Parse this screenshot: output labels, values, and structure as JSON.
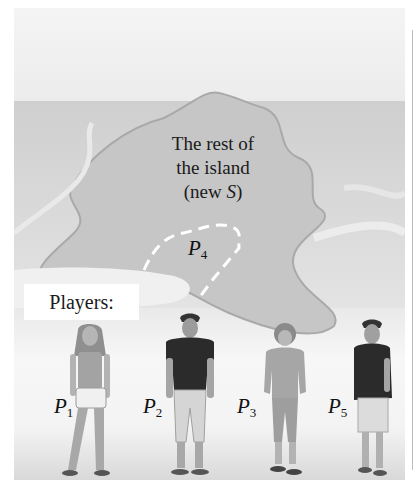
{
  "figure": {
    "island_caption": {
      "line1": "The rest of",
      "line2": "the island",
      "line3_prefix": "(new ",
      "line3_var": "S",
      "line3_suffix": ")"
    },
    "region_label": {
      "var": "P",
      "sub": "4"
    },
    "players_box": "Players:",
    "players": [
      {
        "var": "P",
        "sub": "1",
        "description": "woman with long hair, tank top, shorts"
      },
      {
        "var": "P",
        "sub": "2",
        "description": "man in dark t-shirt, rolled-up pants"
      },
      {
        "var": "P",
        "sub": "3",
        "description": "person with curly hair, long-sleeve top, capri pants"
      },
      {
        "var": "P",
        "sub": "5",
        "description": "man in dark t-shirt, shorts"
      }
    ],
    "colors": {
      "sky": "#f2f2f2",
      "sea": "#d4d4d4",
      "island": "#c4c4c4",
      "beach": "#f4f4f4",
      "dark_shirt": "#2b2b2b",
      "dashed_boundary": "#ffffff"
    }
  }
}
